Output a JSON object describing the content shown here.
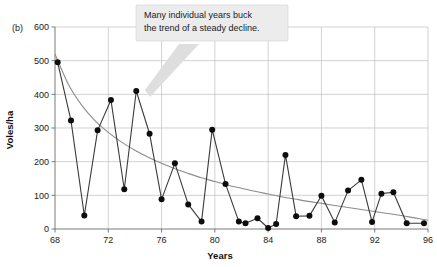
{
  "figure": {
    "panel_label": "(b)",
    "background": "#ffffff"
  },
  "annotation": {
    "line1": "Many individual years buck",
    "line2": "the trend of a steady decline.",
    "box_fill": "#ececec",
    "tail_fill": "#dedede"
  },
  "chart_data": {
    "type": "line",
    "title": "",
    "xlabel": "Years",
    "ylabel": "Voles/ha",
    "xlim": [
      68,
      96
    ],
    "ylim": [
      0,
      600
    ],
    "xticks": [
      68,
      72,
      76,
      80,
      84,
      88,
      92,
      96
    ],
    "yticks": [
      0,
      100,
      200,
      300,
      400,
      500,
      600
    ],
    "xtick_labels": [
      "68",
      "72",
      "76",
      "80",
      "84",
      "88",
      "92",
      "96"
    ],
    "ytick_labels": [
      "0",
      "100",
      "200",
      "300",
      "400",
      "500",
      "600"
    ],
    "grid": true,
    "legend": "none",
    "marker_color": "#0d0d0d",
    "line_color": "#3a3a3a",
    "trend_color": "#8c8c8c",
    "x": [
      68.2,
      69.2,
      70.2,
      71.2,
      72.2,
      73.2,
      74.1,
      75.1,
      76.0,
      77.0,
      78.0,
      79.0,
      79.8,
      80.8,
      81.8,
      82.3,
      83.2,
      84.0,
      84.6,
      85.3,
      86.1,
      87.1,
      88.0,
      89.0,
      90.0,
      91.0,
      91.8,
      92.5,
      93.4,
      94.4,
      95.7
    ],
    "values": [
      495,
      322,
      40,
      293,
      383,
      118,
      410,
      283,
      88,
      195,
      73,
      22,
      295,
      134,
      22,
      17,
      32,
      3,
      15,
      220,
      38,
      39,
      99,
      19,
      114,
      146,
      21,
      105,
      109,
      17,
      17
    ],
    "series": [
      {
        "name": "Voles per hectare",
        "x": [
          68.2,
          69.2,
          70.2,
          71.2,
          72.2,
          73.2,
          74.1,
          75.1,
          76.0,
          77.0,
          78.0,
          79.0,
          79.8,
          80.8,
          81.8,
          82.3,
          83.2,
          84.0,
          84.6,
          85.3,
          86.1,
          87.1,
          88.0,
          89.0,
          90.0,
          91.0,
          91.8,
          92.5,
          93.4,
          94.4,
          95.7
        ],
        "values": [
          495,
          322,
          40,
          293,
          383,
          118,
          410,
          283,
          88,
          195,
          73,
          22,
          295,
          134,
          22,
          17,
          32,
          3,
          15,
          220,
          38,
          39,
          99,
          19,
          114,
          146,
          21,
          105,
          109,
          17,
          17
        ]
      },
      {
        "name": "Declining trend",
        "x": [
          68.0,
          69.0,
          70.0,
          71.0,
          72.0,
          73.0,
          74.0,
          75.0,
          76.0,
          77.0,
          78.0,
          79.0,
          80.0,
          81.0,
          82.0,
          83.0,
          84.0,
          85.0,
          86.0,
          87.0,
          88.0,
          89.0,
          90.0,
          91.0,
          92.0,
          93.0,
          94.0,
          95.0,
          96.0
        ],
        "values": [
          520,
          430,
          368,
          322,
          287,
          258,
          234,
          213,
          195,
          179,
          165,
          152,
          141,
          130,
          121,
          112,
          104,
          96,
          89,
          82,
          76,
          70,
          64,
          58,
          52,
          46,
          40,
          33,
          26
        ]
      }
    ]
  }
}
